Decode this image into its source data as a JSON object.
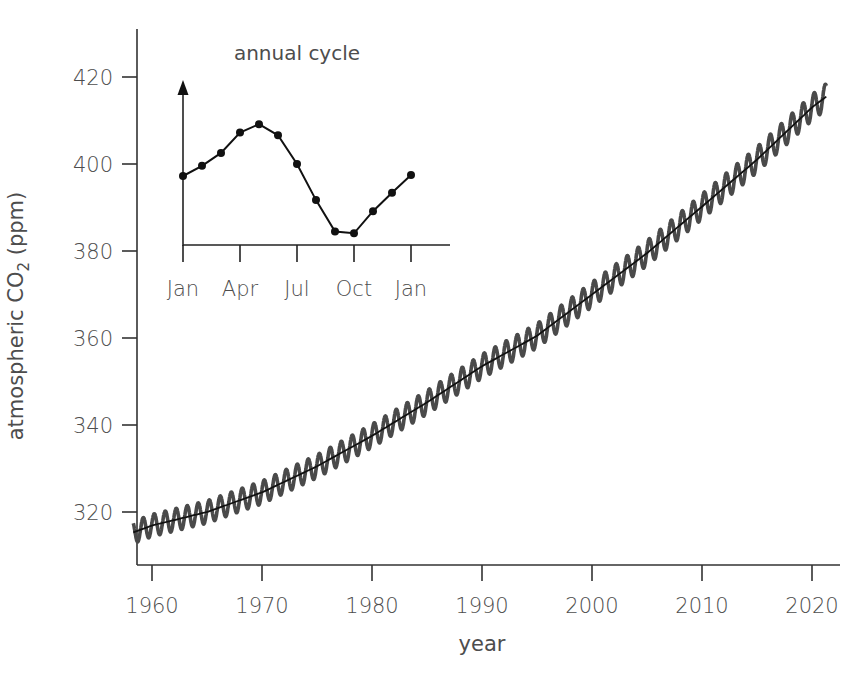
{
  "chart_data": [
    {
      "name": "main",
      "type": "line",
      "title": "",
      "xlabel": "year",
      "ylabel": "atmospheric CO2 (ppm)",
      "ylabel_parts": {
        "pre": "atmospheric CO",
        "sub": "2",
        "post": " (ppm)"
      },
      "xlim": [
        1958,
        2021.5
      ],
      "ylim": [
        310,
        428
      ],
      "xticks": [
        1960,
        1970,
        1980,
        1990,
        2000,
        2010,
        2020
      ],
      "xtick_labels": [
        "1960",
        "1970",
        "1980",
        "1990",
        "2000",
        "2010",
        "2020"
      ],
      "yticks": [
        320,
        340,
        360,
        380,
        400,
        420
      ],
      "ytick_labels": [
        "320",
        "340",
        "360",
        "380",
        "400",
        "420"
      ],
      "grid": false,
      "legend": null,
      "series": [
        {
          "name": "monthly CO2 (seasonal)",
          "style": "thick gray oscillating line",
          "color": "#4a4a4a",
          "seasonal_amplitude_ppm": 3.0,
          "x_range": [
            1958.3,
            2021.3
          ]
        },
        {
          "name": "trend",
          "style": "thin black line",
          "color": "#111111",
          "x": [
            1958.3,
            1960,
            1965,
            1970,
            1975,
            1980,
            1985,
            1990,
            1995,
            2000,
            2005,
            2010,
            2015,
            2020,
            2021.3
          ],
          "y": [
            315.3,
            316.9,
            320.0,
            324.5,
            330.5,
            337.5,
            345.2,
            353.5,
            360.5,
            370.0,
            379.5,
            390.2,
            401.0,
            413.0,
            415.5
          ]
        }
      ]
    },
    {
      "name": "inset",
      "type": "line",
      "title": "annual cycle",
      "categories": [
        "Jan",
        "Feb",
        "Mar",
        "Apr",
        "May",
        "Jun",
        "Jul",
        "Aug",
        "Sep",
        "Oct",
        "Nov",
        "Dec",
        "Jan"
      ],
      "xtick_labels": [
        "Jan",
        "Apr",
        "Jul",
        "Oct",
        "Jan"
      ],
      "values_relative": [
        0.0,
        1.1,
        2.5,
        4.7,
        5.6,
        4.4,
        1.3,
        -2.6,
        -6.0,
        -6.2,
        -3.8,
        -1.8,
        0.1
      ],
      "markers": true,
      "y_axis_arrow": true,
      "ylabel": ""
    }
  ],
  "style": {
    "axis_color": "#333333",
    "text_color": "#4d4d4d",
    "seasonal_color": "#4a4a4a",
    "trend_color": "#111111",
    "background": "#ffffff"
  }
}
